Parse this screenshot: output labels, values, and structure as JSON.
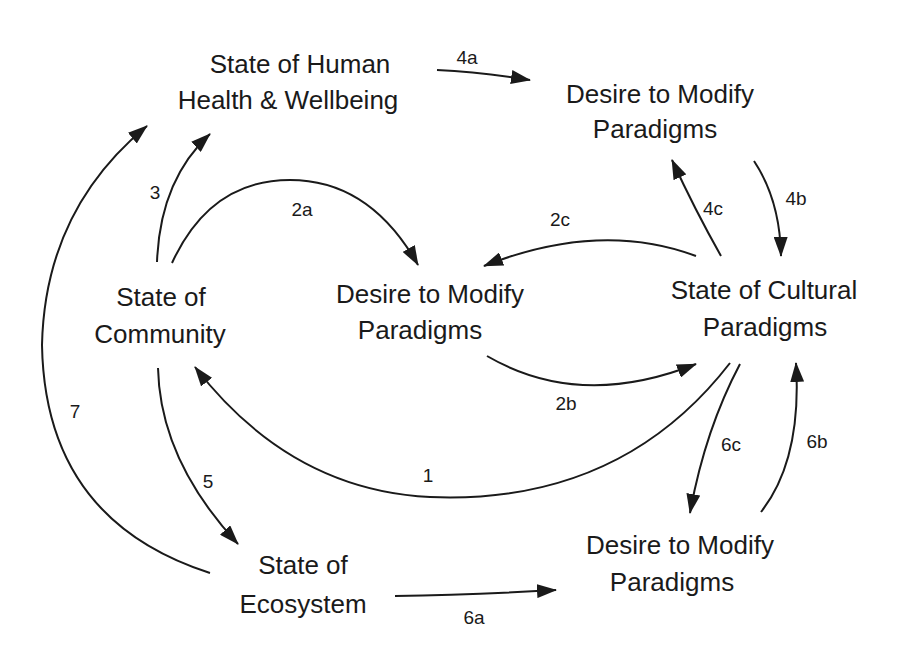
{
  "nodes": {
    "human_health": {
      "line1": "State of Human",
      "line2": "Health & Wellbeing"
    },
    "desire_top": {
      "line1": "Desire to Modify",
      "line2": "Paradigms"
    },
    "community": {
      "line1": "State of",
      "line2": "Community"
    },
    "desire_middle": {
      "line1": "Desire to Modify",
      "line2": "Paradigms"
    },
    "cultural": {
      "line1": "State of Cultural",
      "line2": "Paradigms"
    },
    "ecosystem": {
      "line1": "State of",
      "line2": "Ecosystem"
    },
    "desire_bottom": {
      "line1": "Desire to Modify",
      "line2": "Paradigms"
    }
  },
  "edges": [
    {
      "id": "1",
      "label": "1",
      "from": "State of Cultural Paradigms",
      "to": "State of Community"
    },
    {
      "id": "2a",
      "label": "2a",
      "from": "State of Community",
      "to": "Desire to Modify Paradigms (middle)"
    },
    {
      "id": "2b",
      "label": "2b",
      "from": "Desire to Modify Paradigms (middle)",
      "to": "State of Cultural Paradigms"
    },
    {
      "id": "2c",
      "label": "2c",
      "from": "State of Cultural Paradigms",
      "to": "Desire to Modify Paradigms (middle)"
    },
    {
      "id": "3",
      "label": "3",
      "from": "State of Community",
      "to": "State of Human Health & Wellbeing"
    },
    {
      "id": "4a",
      "label": "4a",
      "from": "State of Human Health & Wellbeing",
      "to": "Desire to Modify Paradigms (top)"
    },
    {
      "id": "4b",
      "label": "4b",
      "from": "Desire to Modify Paradigms (top)",
      "to": "State of Cultural Paradigms"
    },
    {
      "id": "4c",
      "label": "4c",
      "from": "State of Cultural Paradigms",
      "to": "Desire to Modify Paradigms (top)"
    },
    {
      "id": "5",
      "label": "5",
      "from": "State of Community",
      "to": "State of Ecosystem"
    },
    {
      "id": "6a",
      "label": "6a",
      "from": "State of Ecosystem",
      "to": "Desire to Modify Paradigms (bottom)"
    },
    {
      "id": "6b",
      "label": "6b",
      "from": "Desire to Modify Paradigms (bottom)",
      "to": "State of Cultural Paradigms"
    },
    {
      "id": "6c",
      "label": "6c",
      "from": "State of Cultural Paradigms",
      "to": "Desire to Modify Paradigms (bottom)"
    },
    {
      "id": "7",
      "label": "7",
      "from": "State of Ecosystem",
      "to": "State of Human Health & Wellbeing"
    }
  ],
  "edge_labels": {
    "e1": "1",
    "e2a": "2a",
    "e2b": "2b",
    "e2c": "2c",
    "e3": "3",
    "e4a": "4a",
    "e4b": "4b",
    "e4c": "4c",
    "e5": "5",
    "e6a": "6a",
    "e6b": "6b",
    "e6c": "6c",
    "e7": "7"
  },
  "colors": {
    "ink": "#1a1a1a",
    "background": "#ffffff"
  }
}
